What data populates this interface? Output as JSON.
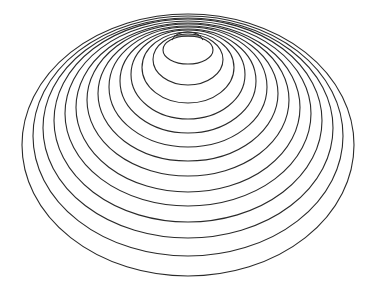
{
  "figure": {
    "type": "nested-ellipses",
    "stroke_color": "#2a2a2a",
    "background": "#ffffff",
    "center_x": 188,
    "rings": [
      {
        "top": 36,
        "bottom": 64,
        "rx": 25
      },
      {
        "top": 34,
        "bottom": 85,
        "rx": 35
      },
      {
        "top": 32,
        "bottom": 103,
        "rx": 46
      },
      {
        "top": 30,
        "bottom": 119,
        "rx": 57
      },
      {
        "top": 29,
        "bottom": 133,
        "rx": 68
      },
      {
        "top": 27,
        "bottom": 147,
        "rx": 79
      },
      {
        "top": 26,
        "bottom": 161,
        "rx": 90
      },
      {
        "top": 24,
        "bottom": 176,
        "rx": 101
      },
      {
        "top": 23,
        "bottom": 192,
        "rx": 112
      },
      {
        "top": 21,
        "bottom": 206,
        "rx": 123
      },
      {
        "top": 19,
        "bottom": 222,
        "rx": 134
      },
      {
        "top": 18,
        "bottom": 238,
        "rx": 145
      },
      {
        "top": 16,
        "bottom": 256,
        "rx": 155
      },
      {
        "top": 14,
        "bottom": 276,
        "rx": 166
      }
    ],
    "cap": {
      "x1": 176,
      "x2": 199,
      "top": 32,
      "base": 40
    }
  }
}
